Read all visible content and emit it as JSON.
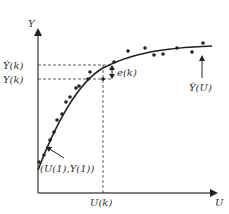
{
  "diagram": {
    "type": "curve-fit-illustration",
    "axes": {
      "y_label": "Y",
      "x_label": "U"
    },
    "labels": {
      "y_hat_k": "Ŷ(k)",
      "y_k": "Y(k)",
      "u_k": "U(k)",
      "error": "e(k)",
      "curve": "Ŷ(U)",
      "first_point": "(U(1),Y(1))"
    },
    "colors": {
      "line": "#222222",
      "axis": "#444444",
      "text": "#333333"
    },
    "points": [
      [
        39,
        162
      ],
      [
        44,
        155
      ],
      [
        50,
        140
      ],
      [
        54,
        132
      ],
      [
        57,
        120
      ],
      [
        62,
        114
      ],
      [
        66,
        102
      ],
      [
        70,
        97
      ],
      [
        76,
        88
      ],
      [
        79,
        86
      ],
      [
        88,
        78
      ],
      [
        90,
        72
      ],
      [
        103,
        65
      ],
      [
        112,
        60
      ],
      [
        128,
        51
      ],
      [
        145,
        48
      ],
      [
        154,
        55
      ],
      [
        163,
        54
      ],
      [
        177,
        48
      ],
      [
        192,
        52
      ],
      [
        203,
        43
      ]
    ]
  }
}
